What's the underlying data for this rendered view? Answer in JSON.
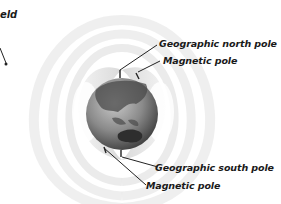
{
  "diagram": {
    "partial_title": "eld",
    "labels": {
      "geographic_north": "Geographic north pole",
      "magnetic_north": "Magnetic pole",
      "geographic_south": "Geographic south pole",
      "magnetic_south": "Magnetic pole"
    },
    "colors": {
      "background": "#ffffff",
      "field_lines": "#e6e6e6",
      "globe_dark": "#3a3a3a",
      "globe_light": "#b8b8b8",
      "text": "#1a1a1a"
    }
  }
}
